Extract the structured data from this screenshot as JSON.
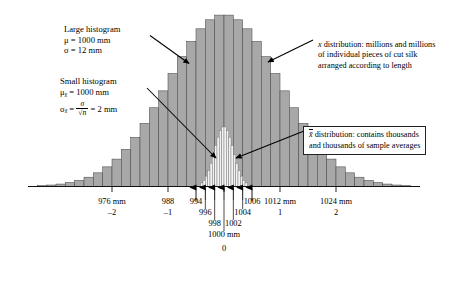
{
  "figure": {
    "type": "histogram-diagram",
    "title_present": false
  },
  "annotations": {
    "large_histogram": {
      "heading": "Large histogram",
      "mu_label": "μ = 1000 mm",
      "sigma_label": "σ = 12 mm"
    },
    "small_histogram": {
      "heading": "Small histogram",
      "mu_prefix": "μ",
      "mu_sub": "x̄",
      "mu_value": "= 1000 mm",
      "sigma_prefix": "σ",
      "sigma_sub": "x̄",
      "sigma_eq": "=",
      "frac_num": "σ",
      "frac_den": "√n",
      "sigma_value": "= 2 mm"
    },
    "x_distribution": {
      "line1_symbol": "x",
      "line1": "distribution: millions and millions",
      "line2": "of individual pieces of cut silk",
      "line3": "arranged according to length"
    },
    "xbar_distribution": {
      "symbol": "x̄",
      "line1": "distribution: contains thousands",
      "line2": "and thousands of sample averages"
    }
  },
  "chart_data": {
    "type": "histogram",
    "title": "",
    "xlabel": "",
    "ylabel": "",
    "grid": false,
    "legend": "none",
    "xlim": [
      958,
      1042
    ],
    "series": [
      {
        "name": "x distribution (large histogram)",
        "mu": 1000,
        "sigma": 12,
        "fill": "#a8a8a8",
        "note": "population of individual cut silk pieces"
      },
      {
        "name": "x̄ distribution (small histogram)",
        "mu": 1000,
        "sigma": 2,
        "fill": "#f2f2f2",
        "note": "distribution of sample averages"
      }
    ],
    "major_ticks": [
      {
        "value": 976,
        "label": "976 mm",
        "z": "–2"
      },
      {
        "value": 988,
        "label": "988",
        "z": "–1"
      },
      {
        "value": 1000,
        "label": "1000 mm",
        "z": "0"
      },
      {
        "value": 1012,
        "label": "1012 mm",
        "z": "1"
      },
      {
        "value": 1024,
        "label": "1024 mm",
        "z": "2"
      }
    ],
    "arrow_ticks": [
      {
        "value": 994,
        "label": "994"
      },
      {
        "value": 996,
        "label": "996"
      },
      {
        "value": 998,
        "label": "998"
      },
      {
        "value": 1000,
        "label": "1000 mm"
      },
      {
        "value": 1002,
        "label": "1002"
      },
      {
        "value": 1004,
        "label": "1004"
      },
      {
        "value": 1006,
        "label": "1006"
      }
    ]
  },
  "colors": {
    "bar_fill": "#a8a8a8",
    "bar_edge": "#4a4a4a",
    "small_fill": "#f2f2f2",
    "axis": "#111111",
    "text": "#000000",
    "box_border": "#222222"
  }
}
